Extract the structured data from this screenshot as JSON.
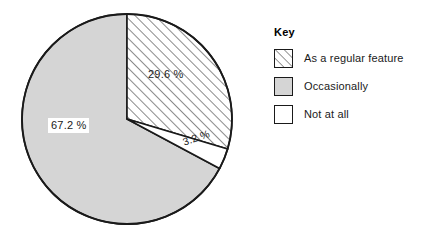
{
  "chart_data": {
    "type": "pie",
    "title": "",
    "categories": [
      "As a regular feature",
      "Occasionally",
      "Not at all"
    ],
    "values": [
      29.6,
      67.2,
      3.2
    ],
    "value_labels": [
      "29.6 %",
      "67.2 %",
      "3.2 %"
    ],
    "unit": "%",
    "start_angle_deg": 0,
    "direction": "clockwise",
    "slices": [
      {
        "name": "As a regular feature",
        "value": 29.6,
        "label": "29.6 %",
        "fill": "hatched",
        "fill_color": "#ffffff",
        "hatch": "diagonal-45",
        "start_deg": 0,
        "sweep_deg": 106.6
      },
      {
        "name": "Not at all",
        "value": 3.2,
        "label": "3.2 %",
        "fill": "solid",
        "fill_color": "#ffffff",
        "start_deg": 106.6,
        "sweep_deg": 11.5
      },
      {
        "name": "Occasionally",
        "value": 67.2,
        "label": "67.2 %",
        "fill": "solid",
        "fill_color": "#d5d5d5",
        "start_deg": 118.1,
        "sweep_deg": 241.9
      }
    ],
    "legend": {
      "position": "right",
      "title": "Key",
      "entries": [
        {
          "label": "As a regular feature",
          "swatch": "hatched",
          "color": "#ffffff"
        },
        {
          "label": "Occasionally",
          "swatch": "solid",
          "color": "#d5d5d5"
        },
        {
          "label": "Not at all",
          "swatch": "solid",
          "color": "#ffffff"
        }
      ]
    },
    "colors": {
      "gray_fill": "#d5d5d5",
      "outline": "#1a1a1a",
      "background": "#ffffff"
    },
    "geometry": {
      "cx": 127,
      "cy": 119,
      "r": 105
    }
  },
  "pie": {
    "label_hatched": "29.6 %",
    "label_gray": "67.2 %",
    "label_white": "3.2 %"
  },
  "legend": {
    "title": "Key",
    "item_0_label": "As a regular feature",
    "item_1_label": "Occasionally",
    "item_2_label": "Not at all"
  }
}
